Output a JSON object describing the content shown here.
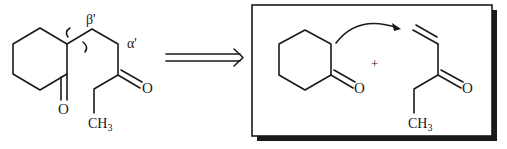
{
  "diagram": {
    "type": "retrosynthesis",
    "target_molecule": {
      "name": "2-(3-oxopentyl)cyclohexanone",
      "labels": {
        "beta_prime": "β'",
        "alpha_prime": "α'",
        "ring_oxygen": "O",
        "chain_oxygen": "O",
        "methyl": "CH",
        "methyl_sub": "3"
      },
      "disconnection_mark": "wavy bond cut between ring C2 and β' carbon"
    },
    "retro_arrow": "⟹",
    "synthons_box": {
      "reactant_1": {
        "name": "cyclohexanone",
        "oxygen": "O"
      },
      "plus": "+",
      "reactant_2": {
        "name": "1-penten-3-one (ethyl vinyl ketone)",
        "oxygen": "O",
        "methyl": "CH",
        "methyl_sub": "3"
      },
      "curved_arrow": "enolate α-carbon attacks vinyl terminus (Michael addition)"
    },
    "colors": {
      "ink": "#1a1a1a",
      "background": "#ffffff",
      "box_shadow": "#1a1a1a"
    }
  }
}
